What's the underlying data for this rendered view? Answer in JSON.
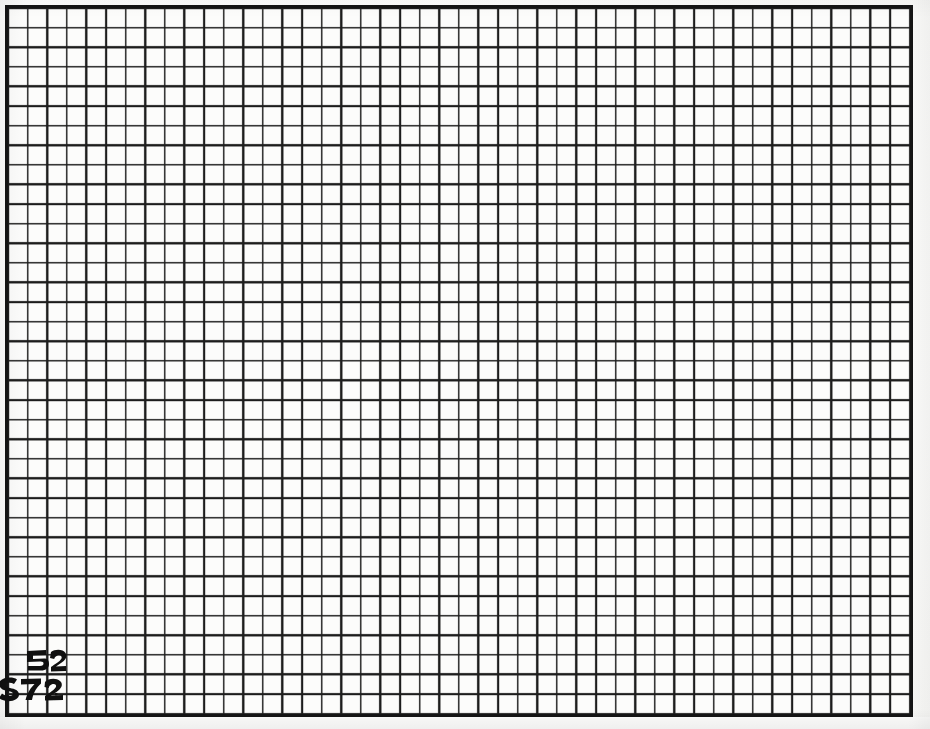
{
  "image": {
    "kind": "scanned-grid-paper",
    "title": "Scanned graph paper sheet with handwritten ink marks",
    "width": 930,
    "height": 729,
    "background_color": "#fcfcfb",
    "ink_color": "#101010"
  },
  "grid": {
    "name": "ruled-grid-field",
    "columns": 46,
    "rows": 36,
    "cell_size_px": 19.6,
    "line_color": "#1c1c1c",
    "line_width_px": 1.6,
    "border_color": "#141414",
    "border_width_px": 3,
    "left_px": 5,
    "top_px": 5,
    "width_px": 908,
    "height_px": 712
  },
  "annotations": {
    "label": "handwritten-ink-marks",
    "count": 2,
    "marks": [
      {
        "name": "ink-mark-upper",
        "reading": "52",
        "color": "#101010",
        "left_px": 24,
        "top_px": 646,
        "width_px": 44,
        "height_px": 30,
        "grid_cell_col": 1,
        "grid_cell_row": 33
      },
      {
        "name": "ink-mark-lower",
        "reading": "572",
        "color": "#101010",
        "left_px": -2,
        "top_px": 673,
        "width_px": 70,
        "height_px": 32,
        "grid_cell_col": 0,
        "grid_cell_row": 34
      }
    ]
  },
  "margins": {
    "top_px": 5,
    "left_px": 5,
    "right_px": 17,
    "bottom_px": 12
  }
}
